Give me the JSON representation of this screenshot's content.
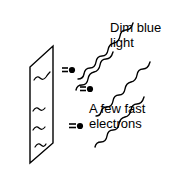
{
  "figure": {
    "background_color": "#ffffff",
    "ink_color": "#000000",
    "width": 176,
    "height": 177
  },
  "labels": {
    "light": {
      "name": "dim-blue-light-label",
      "line1": "Dim blue",
      "line2": "light"
    },
    "electrons": {
      "name": "a-few-fast-electrons-label",
      "line1": "A few fast",
      "line2": "electrons"
    }
  },
  "plate": {
    "name": "metal-plate",
    "shape": "parallelogram",
    "corners": [
      [
        53,
        46
      ],
      [
        53,
        143
      ],
      [
        30,
        163
      ],
      [
        30,
        67
      ]
    ]
  },
  "light_waves": {
    "name": "incoming-light-waves",
    "count": 4,
    "description": "wavy sinusoidal lines travelling down-left toward the plate",
    "paths": [
      {
        "start": [
          133,
          23
        ],
        "end": [
          57,
          72
        ]
      },
      {
        "start": [
          150,
          62
        ],
        "end": [
          78,
          108
        ]
      },
      {
        "start": [
          144,
          97
        ],
        "end": [
          66,
          140
        ]
      },
      {
        "start": [
          113,
          52
        ],
        "end": [
          56,
          88
        ]
      }
    ]
  },
  "surface_waves": {
    "name": "plate-surface-waves",
    "count": 4,
    "description": "small wavy marks drawn on the face of the metal plate"
  },
  "electrons": {
    "name": "ejected-electrons",
    "count": 3,
    "symbol": "filled dot with two short motion dashes",
    "positions": [
      [
        71,
        70
      ],
      [
        89,
        89
      ],
      [
        79,
        126
      ]
    ]
  }
}
